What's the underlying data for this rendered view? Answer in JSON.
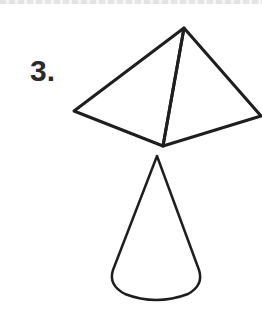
{
  "figure": {
    "number_label": "3.",
    "stroke_color": "#1e1e1e",
    "shapes": [
      {
        "name": "pyramid",
        "vertices": {
          "apex": [
            184,
            28
          ],
          "left": [
            74,
            111
          ],
          "front": [
            163,
            146
          ],
          "right": [
            261,
            116
          ]
        }
      },
      {
        "name": "cone",
        "tip": [
          157,
          156
        ],
        "base_center": [
          156,
          282
        ],
        "base_rx": 45,
        "base_ry": 20
      }
    ]
  }
}
